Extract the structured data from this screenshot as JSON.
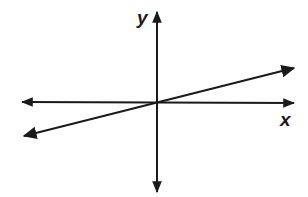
{
  "diagram": {
    "type": "coordinate-plane-with-line",
    "axes": {
      "x_label": "x",
      "y_label": "y"
    },
    "line": {
      "description": "straight line through origin with small positive slope",
      "passes_through_origin": true,
      "slope_sign": "positive"
    },
    "colors": {
      "stroke": "#1a1a1a",
      "background": "#ffffff"
    }
  }
}
